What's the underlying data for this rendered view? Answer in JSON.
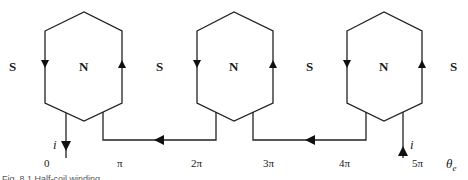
{
  "diagram": {
    "type": "half-coil winding schematic",
    "poles": [
      {
        "label": "S"
      },
      {
        "label": "N"
      },
      {
        "label": "S"
      },
      {
        "label": "N"
      },
      {
        "label": "S"
      },
      {
        "label": "N"
      },
      {
        "label": "S"
      }
    ],
    "coils": [
      {
        "pole": "N",
        "left_side_current": "down",
        "right_side_current": "up"
      },
      {
        "pole": "N",
        "left_side_current": "down",
        "right_side_current": "up"
      },
      {
        "pole": "N",
        "left_side_current": "down",
        "right_side_current": "up"
      }
    ],
    "current_label": "i",
    "angle_ticks": [
      "0",
      "π",
      "2π",
      "3π",
      "4π",
      "5π"
    ],
    "axis_label": "θ",
    "axis_label_sub": "e",
    "caption": "Fig. 8.1  Half-coil winding"
  },
  "colors": {
    "line": "#222222",
    "text": "#1a1a1a",
    "background": "#ffffff"
  }
}
